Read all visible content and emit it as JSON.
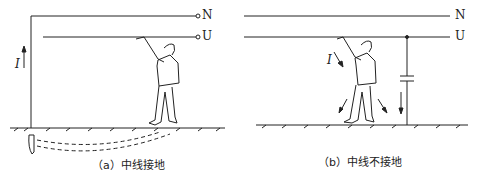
{
  "figure_a": {
    "caption": "（a）中线接地",
    "line_n": "N",
    "line_u": "U",
    "current_label": "I"
  },
  "figure_b": {
    "caption": "（b）中线不接地",
    "line_n": "N",
    "line_u": "U",
    "current_label": "I"
  },
  "colors": {
    "ink": "#222222",
    "background": "#ffffff"
  }
}
